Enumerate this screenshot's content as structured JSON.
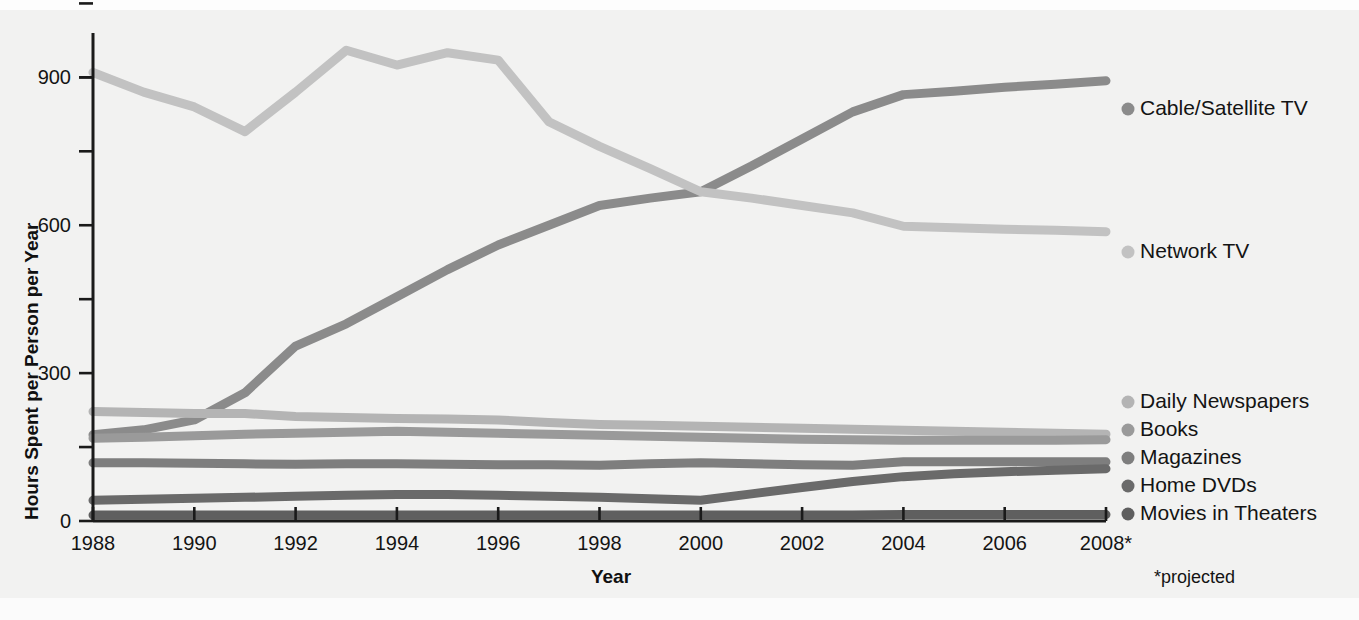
{
  "chart_data": {
    "type": "line",
    "title": "",
    "xlabel": "Year",
    "ylabel": "Hours Spent per Person per Year",
    "xlim": [
      1988,
      2008
    ],
    "ylim": [
      0,
      990
    ],
    "yticks": [
      0,
      300,
      600,
      900
    ],
    "ytick_labels": [
      "0",
      "300",
      "600",
      "900"
    ],
    "yminor_ticks": [
      150,
      450,
      750,
      900,
      1050
    ],
    "xticks": [
      1988,
      1990,
      1992,
      1994,
      1996,
      1998,
      2000,
      2002,
      2004,
      2006,
      2008
    ],
    "xtick_labels": [
      "1988",
      "1990",
      "1992",
      "1994",
      "1996",
      "1998",
      "2000",
      "2002",
      "2004",
      "2006",
      "2008*"
    ],
    "grid": false,
    "legend_position": "right",
    "footnote": "*projected",
    "x": [
      1988,
      1989,
      1990,
      1991,
      1992,
      1993,
      1994,
      1995,
      1996,
      1997,
      1998,
      1999,
      2000,
      2001,
      2002,
      2003,
      2004,
      2005,
      2006,
      2007,
      2008
    ],
    "series": [
      {
        "name": "Cable/Satellite TV",
        "color": "#8b8b8b",
        "values": [
          175,
          185,
          205,
          260,
          355,
          400,
          455,
          510,
          560,
          600,
          640,
          655,
          668,
          720,
          775,
          830,
          865,
          872,
          880,
          886,
          893
        ]
      },
      {
        "name": "Network TV",
        "color": "#c2c2c2",
        "values": [
          910,
          870,
          840,
          790,
          870,
          955,
          925,
          950,
          935,
          810,
          760,
          715,
          668,
          655,
          640,
          625,
          598,
          595,
          592,
          590,
          587
        ]
      },
      {
        "name": "Daily Newspapers",
        "color": "#b4b4b4",
        "values": [
          222,
          220,
          218,
          218,
          212,
          210,
          208,
          207,
          205,
          200,
          196,
          194,
          192,
          190,
          188,
          186,
          184,
          182,
          180,
          178,
          176
        ]
      },
      {
        "name": "Books",
        "color": "#9a9a9a",
        "values": [
          168,
          170,
          173,
          176,
          178,
          180,
          182,
          180,
          178,
          176,
          174,
          172,
          170,
          168,
          166,
          165,
          164,
          164,
          164,
          164,
          165
        ]
      },
      {
        "name": "Magazines",
        "color": "#7e7e7e",
        "values": [
          118,
          118,
          117,
          116,
          115,
          116,
          116,
          115,
          114,
          114,
          113,
          116,
          118,
          116,
          114,
          113,
          120,
          120,
          120,
          120,
          120
        ]
      },
      {
        "name": "Home DVDs",
        "color": "#6a6a6a",
        "values": [
          42,
          44,
          46,
          48,
          50,
          52,
          54,
          54,
          52,
          50,
          48,
          45,
          42,
          55,
          68,
          80,
          90,
          96,
          100,
          103,
          106
        ]
      },
      {
        "name": "Movies in Theaters",
        "color": "#5f5f5f",
        "values": [
          12,
          12,
          12,
          12,
          12,
          12,
          12,
          12,
          12,
          12,
          12,
          12,
          12,
          12,
          12,
          12,
          13,
          13,
          13,
          13,
          13
        ]
      }
    ],
    "legend": [
      {
        "label": "Cable/Satellite TV",
        "color": "#8b8b8b",
        "y": 115
      },
      {
        "label": "Network TV",
        "color": "#c2c2c2",
        "y": 258
      },
      {
        "label": "Daily Newspapers",
        "color": "#b4b4b4",
        "y": 408
      },
      {
        "label": "Books",
        "color": "#9a9a9a",
        "y": 436
      },
      {
        "label": "Magazines",
        "color": "#7e7e7e",
        "y": 464
      },
      {
        "label": "Home DVDs",
        "color": "#6a6a6a",
        "y": 492
      },
      {
        "label": "Movies in Theaters",
        "color": "#5f5f5f",
        "y": 520
      }
    ]
  }
}
